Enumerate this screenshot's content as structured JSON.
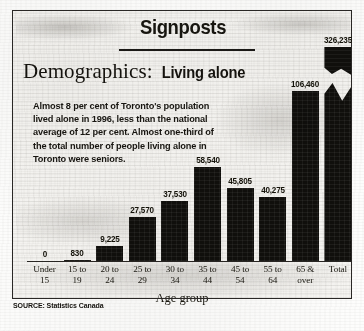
{
  "masthead": {
    "title": "Signposts"
  },
  "headline": {
    "serif_part": "Demographics:",
    "bold_part": "Living alone"
  },
  "deck": {
    "text": "Almost 8 per cent of Toronto's population lived alone in 1996, less than the national average of 12 per cent. Almost one-third of the total number of people living alone in Toronto were seniors."
  },
  "source": {
    "text": "SOURCE: Statistics Canada"
  },
  "chart_data": {
    "type": "bar",
    "xlabel": "Age group",
    "ylabel": "",
    "grid": false,
    "legend": "none",
    "axis_note": "Total bar is drawn with a broken axis",
    "categories": [
      "Under 15",
      "15 to 19",
      "20 to 24",
      "25 to 29",
      "30 to 34",
      "35 to 44",
      "45 to 54",
      "55 to 64",
      "65 & over",
      "Total"
    ],
    "values": [
      0,
      830,
      9225,
      27570,
      37530,
      58540,
      45805,
      40275,
      106460,
      326235
    ],
    "value_labels": [
      "0",
      "830",
      "9,225",
      "27,570",
      "37,530",
      "58,540",
      "45,805",
      "40,275",
      "106,460",
      "326,235"
    ],
    "tick_lines": [
      [
        "Under",
        "15"
      ],
      [
        "15 to",
        "19"
      ],
      [
        "20 to",
        "24"
      ],
      [
        "25 to",
        "29"
      ],
      [
        "30 to",
        "34"
      ],
      [
        "35 to",
        "44"
      ],
      [
        "45 to",
        "54"
      ],
      [
        "55 to",
        "64"
      ],
      [
        "65 &",
        "over"
      ],
      [
        "Total",
        ""
      ]
    ],
    "bar_color": "#100f0c",
    "background": "#f6f5f2"
  }
}
